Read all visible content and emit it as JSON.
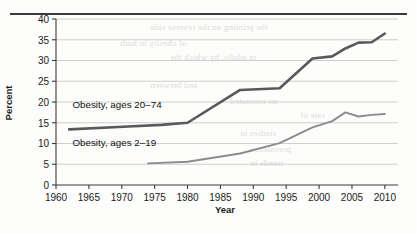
{
  "chart_data": {
    "type": "line",
    "title": "",
    "xlabel": "Year",
    "ylabel": "Percent",
    "xlim": [
      1960,
      2012
    ],
    "ylim": [
      0,
      40
    ],
    "xticks": [
      1960,
      1965,
      1970,
      1975,
      1980,
      1985,
      1990,
      1995,
      2000,
      2005,
      2010
    ],
    "yticks": [
      0,
      5,
      10,
      15,
      20,
      25,
      30,
      35,
      40
    ],
    "grid": "horizontal",
    "legend_position": "inline-annotations",
    "series": [
      {
        "name": "Obesity, ages 20–74",
        "color": "#595959",
        "width": 2.6,
        "x": [
          1962,
          1971,
          1976,
          1980,
          1988,
          1994,
          1999,
          2002,
          2004,
          2006,
          2008,
          2010
        ],
        "values": [
          13.4,
          14.1,
          14.5,
          15.0,
          22.9,
          23.3,
          30.5,
          31.0,
          32.9,
          34.3,
          34.4,
          36.5
        ]
      },
      {
        "name": "Obesity, ages 2–19",
        "color": "#8c8c8c",
        "width": 1.9,
        "x": [
          1974,
          1980,
          1988,
          1994,
          1999,
          2002,
          2004,
          2006,
          2008,
          2010
        ],
        "values": [
          5.2,
          5.6,
          7.6,
          10.1,
          13.9,
          15.4,
          17.5,
          16.5,
          16.9,
          17.1
        ]
      }
    ],
    "annotations": [
      {
        "text": "Obesity, ages 20–74",
        "x": 1962.5,
        "y": 18.6
      },
      {
        "text": "Obesity, ages 2–19",
        "x": 1962.5,
        "y": 9.3
      }
    ]
  },
  "ticks": {
    "y": [
      "40",
      "35",
      "30",
      "25",
      "20",
      "15",
      "10",
      "5",
      "0"
    ],
    "x": [
      "1960",
      "1965",
      "1970",
      "1975",
      "1980",
      "1985",
      "1990",
      "1995",
      "2000",
      "2005",
      "2010"
    ]
  },
  "labels": {
    "y_axis_title": "Percent",
    "x_axis_title": "Year",
    "series_adult": "Obesity, ages 20–74",
    "series_youth": "Obesity, ages 2–19"
  },
  "colors": {
    "adult_line": "#595959",
    "youth_line": "#8c8c8c",
    "grid": "#c9c9c9",
    "axis": "#3b3b3b",
    "text": "#1b1b1b",
    "page": "#fdfdfc",
    "rule": "#3b3b3b"
  },
  "background_bleed": [
    {
      "text": "the printing on the reverse side",
      "x": 150,
      "y": 22
    },
    {
      "text": "of obesity in both",
      "x": 120,
      "y": 38
    },
    {
      "text": "in adults, by which the",
      "x": 170,
      "y": 52
    },
    {
      "text": "and between",
      "x": 150,
      "y": 80
    },
    {
      "text": "an estimated",
      "x": 230,
      "y": 96
    },
    {
      "text": "rate of",
      "x": 300,
      "y": 110
    },
    {
      "text": "studies in",
      "x": 240,
      "y": 128
    },
    {
      "text": "prevalence",
      "x": 250,
      "y": 144
    },
    {
      "text": "trends in",
      "x": 250,
      "y": 158
    }
  ]
}
